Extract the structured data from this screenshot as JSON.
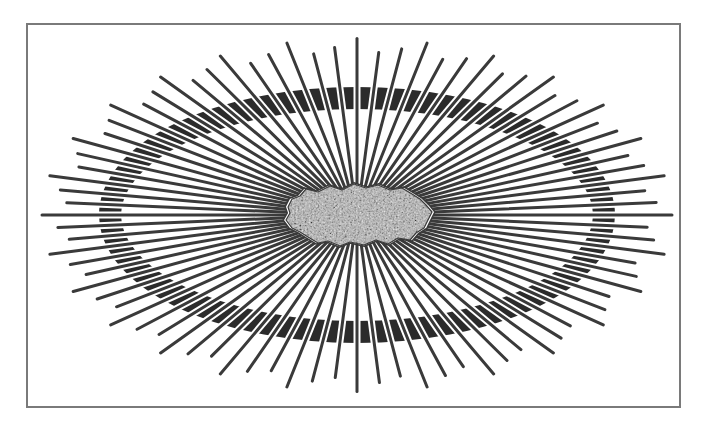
{
  "figure": {
    "title": "",
    "frame": {
      "x": 26,
      "y": 23,
      "width": 655,
      "height": 385,
      "border_color": "#7a7a7a"
    },
    "center": {
      "x": 357,
      "y": 215
    },
    "ring": {
      "rx": 247,
      "ry": 117,
      "thickness": 22,
      "color": "#2b2b2b"
    },
    "rays": {
      "count": 84,
      "outer_rx": 300,
      "outer_ry": 168,
      "inner_rx": 40,
      "inner_ry": 20,
      "jitter": 0.05,
      "stroke_width": 3,
      "color": "#3a3a3a",
      "halo_color": "#ffffff",
      "halo_width": 7
    },
    "blob": {
      "fill": "#b8b8b8",
      "outline_color": "#3a3a3a",
      "speckle_color": "#6a6a6a",
      "points": [
        [
          288,
          207
        ],
        [
          292,
          199
        ],
        [
          300,
          196
        ],
        [
          306,
          189
        ],
        [
          318,
          192
        ],
        [
          330,
          186
        ],
        [
          342,
          190
        ],
        [
          354,
          184
        ],
        [
          366,
          188
        ],
        [
          378,
          185
        ],
        [
          390,
          190
        ],
        [
          402,
          188
        ],
        [
          412,
          194
        ],
        [
          420,
          199
        ],
        [
          426,
          205
        ],
        [
          432,
          212
        ],
        [
          428,
          220
        ],
        [
          424,
          228
        ],
        [
          416,
          233
        ],
        [
          410,
          240
        ],
        [
          398,
          238
        ],
        [
          388,
          244
        ],
        [
          376,
          240
        ],
        [
          364,
          245
        ],
        [
          350,
          242
        ],
        [
          340,
          246
        ],
        [
          328,
          241
        ],
        [
          318,
          243
        ],
        [
          308,
          237
        ],
        [
          300,
          232
        ],
        [
          292,
          228
        ],
        [
          286,
          220
        ],
        [
          290,
          213
        ]
      ]
    }
  },
  "labels": {
    "blob": "central cell body",
    "ring": "elliptical band",
    "rays": "radiating spines"
  }
}
